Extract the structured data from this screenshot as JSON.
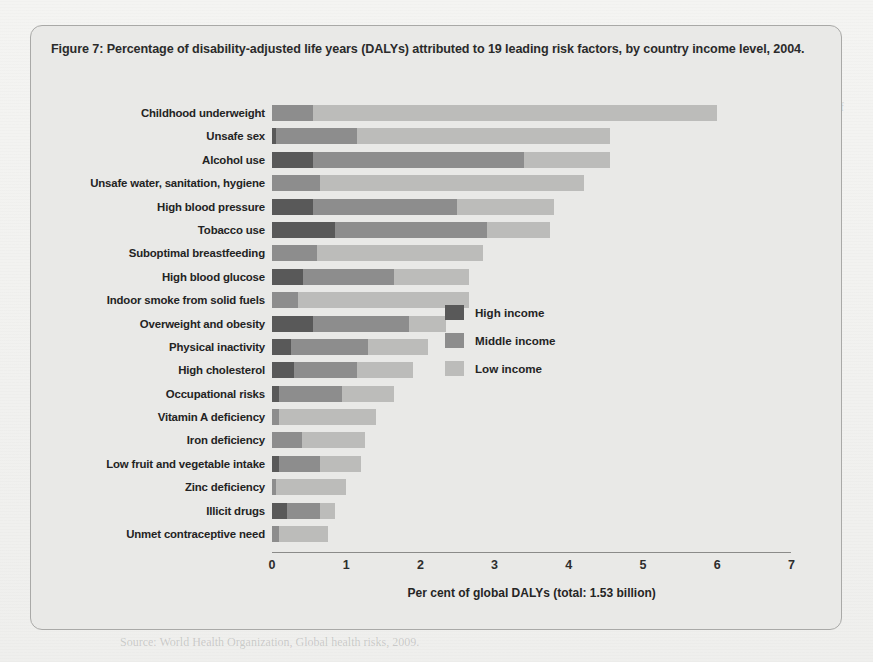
{
  "figure": {
    "title": "Figure 7: Percentage of disability-adjusted life years (DALYs) attributed to 19 leading risk factors, by country income level, 2004."
  },
  "legend": {
    "items": [
      {
        "label": "High income",
        "color": "#595959",
        "key": "high"
      },
      {
        "label": "Middle income",
        "color": "#8d8d8d",
        "key": "mid"
      },
      {
        "label": "Low income",
        "color": "#bcbcba",
        "key": "low"
      }
    ]
  },
  "page_background_text": {
    "right_column": "and the causes of ill health. The World Health Organization has documented the enormous contribution of a small number of risk factors to the global burden of disease, and these are reproduced in Figure 7 below.",
    "bottom_note": "Source: World Health Organization, Global health risks, 2009."
  },
  "chart_data": {
    "type": "bar",
    "orientation": "horizontal",
    "stacked": true,
    "title": "Percentage of disability-adjusted life years (DALYs) attributed to 19 leading risk factors, by country income level, 2004.",
    "xlabel": "Per cent of global DALYs (total: 1.53 billion)",
    "ylabel": "",
    "xlim": [
      0,
      7
    ],
    "xticks": [
      0,
      1,
      2,
      3,
      4,
      5,
      6,
      7
    ],
    "xtick_labels": [
      "0",
      "1",
      "2",
      "3",
      "4",
      "5",
      "6",
      "7"
    ],
    "grid": false,
    "legend_position": "right-middle",
    "units": "per cent of global DALYs",
    "total_dalys": "1.53 billion",
    "categories": [
      "Childhood underweight",
      "Unsafe sex",
      "Alcohol use",
      "Unsafe water, sanitation, hygiene",
      "High blood pressure",
      "Tobacco use",
      "Suboptimal breastfeeding",
      "High blood glucose",
      "Indoor smoke from solid fuels",
      "Overweight and obesity",
      "Physical inactivity",
      "High cholesterol",
      "Occupational risks",
      "Vitamin A deficiency",
      "Iron deficiency",
      "Low fruit and vegetable intake",
      "Zinc deficiency",
      "Illicit drugs",
      "Unmet contraceptive need"
    ],
    "series": [
      {
        "name": "High income",
        "color": "#595959",
        "values": [
          0.0,
          0.05,
          0.55,
          0.0,
          0.55,
          0.85,
          0.0,
          0.42,
          0.0,
          0.55,
          0.25,
          0.3,
          0.1,
          0.0,
          0.0,
          0.1,
          0.0,
          0.2,
          0.0
        ]
      },
      {
        "name": "Middle income",
        "color": "#8d8d8d",
        "values": [
          0.55,
          1.1,
          2.85,
          0.65,
          1.95,
          2.05,
          0.6,
          1.23,
          0.35,
          1.3,
          1.05,
          0.85,
          0.85,
          0.1,
          0.4,
          0.55,
          0.05,
          0.45,
          0.1
        ]
      },
      {
        "name": "Low income",
        "color": "#bcbcba",
        "values": [
          5.45,
          3.4,
          1.15,
          3.55,
          1.3,
          0.85,
          2.25,
          1.0,
          2.3,
          0.5,
          0.8,
          0.75,
          0.7,
          1.3,
          0.85,
          0.55,
          0.95,
          0.2,
          0.65
        ]
      }
    ],
    "totals": [
      6.0,
      4.55,
      4.55,
      4.2,
      3.8,
      3.75,
      2.85,
      2.65,
      2.65,
      2.35,
      2.1,
      1.9,
      1.65,
      1.4,
      1.25,
      1.2,
      1.0,
      0.85,
      0.75
    ]
  }
}
